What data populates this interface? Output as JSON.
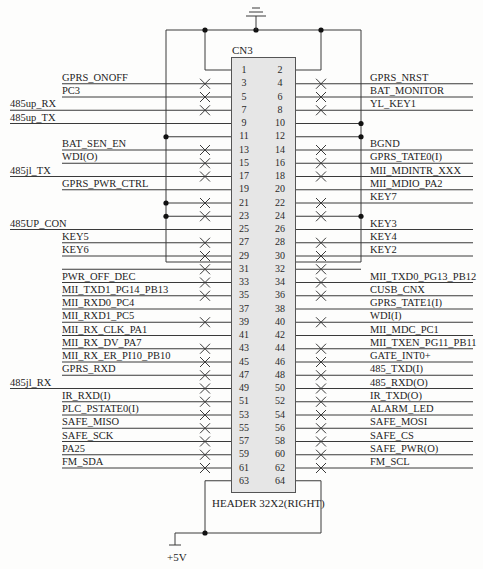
{
  "component": {
    "ref": "CN3",
    "part": "HEADER 32X2(RIGHT)",
    "power_label": "+5V",
    "ground_symbol": "ground-icon"
  },
  "pins": [
    {
      "odd": 1,
      "even": 2,
      "left": "",
      "left_far": false,
      "left_nc": false,
      "right": "",
      "right_nc": false,
      "left_rail": false,
      "right_rail": false
    },
    {
      "odd": 3,
      "even": 4,
      "left": "GPRS_ONOFF",
      "left_far": false,
      "left_nc": true,
      "right": "GPRS_NRST",
      "right_nc": true
    },
    {
      "odd": 5,
      "even": 6,
      "left": "PC3",
      "left_far": false,
      "left_nc": true,
      "right": "BAT_MONITOR",
      "right_nc": true
    },
    {
      "odd": 7,
      "even": 8,
      "left": "485up_RX",
      "left_far": true,
      "left_nc": true,
      "right": "YL_KEY1",
      "right_nc": true
    },
    {
      "odd": 9,
      "even": 10,
      "left": "485up_TX",
      "left_far": true,
      "left_nc": false,
      "right": "",
      "right_nc": false,
      "right_rail": true
    },
    {
      "odd": 11,
      "even": 12,
      "left": "",
      "left_far": false,
      "left_nc": false,
      "left_rail": true,
      "right": "",
      "right_nc": false,
      "right_rail": true
    },
    {
      "odd": 13,
      "even": 14,
      "left": "BAT_SEN_EN",
      "left_far": false,
      "left_nc": true,
      "right": "BGND",
      "right_nc": true
    },
    {
      "odd": 15,
      "even": 16,
      "left": "WDI(O)",
      "left_far": false,
      "left_nc": true,
      "right": "GPRS_TATE0(I)",
      "right_nc": true
    },
    {
      "odd": 17,
      "even": 18,
      "left": "485jl_TX",
      "left_far": true,
      "left_nc": true,
      "right": "MII_MDINTR_XXX",
      "right_nc": true
    },
    {
      "odd": 19,
      "even": 20,
      "left": "GPRS_PWR_CTRL",
      "left_far": false,
      "left_nc": false,
      "right": "MII_MDIO_PA2",
      "right_nc": false
    },
    {
      "odd": 21,
      "even": 22,
      "left": "",
      "left_far": false,
      "left_nc": true,
      "left_rail": true,
      "right": "KEY7",
      "right_nc": true
    },
    {
      "odd": 23,
      "even": 24,
      "left": "",
      "left_far": false,
      "left_nc": true,
      "left_rail": true,
      "right": "",
      "right_nc": true,
      "right_rail": true
    },
    {
      "odd": 25,
      "even": 26,
      "left": "485UP_CON",
      "left_far": true,
      "left_nc": false,
      "right": "KEY3",
      "right_nc": false
    },
    {
      "odd": 27,
      "even": 28,
      "left": "KEY5",
      "left_far": false,
      "left_nc": true,
      "right": "KEY4",
      "right_nc": true
    },
    {
      "odd": 29,
      "even": 30,
      "left": "KEY6",
      "left_far": false,
      "left_nc": true,
      "right": "KEY2",
      "right_nc": true
    },
    {
      "odd": 31,
      "even": 32,
      "left": "",
      "left_far": false,
      "left_nc": true,
      "right": "",
      "right_nc": true
    },
    {
      "odd": 33,
      "even": 34,
      "left": "PWR_OFF_DEC",
      "left_far": false,
      "left_nc": true,
      "right": "MII_TXD0_PG13_PB12",
      "right_nc": true
    },
    {
      "odd": 35,
      "even": 36,
      "left": "MII_TXD1_PG14_PB13",
      "left_far": false,
      "left_nc": true,
      "right": "CUSB_CNX",
      "right_nc": true
    },
    {
      "odd": 37,
      "even": 38,
      "left": "MII_RXD0_PC4",
      "left_far": false,
      "left_nc": false,
      "right": "GPRS_TATE1(I)",
      "right_nc": false
    },
    {
      "odd": 39,
      "even": 40,
      "left": "MII_RXD1_PC5",
      "left_far": false,
      "left_nc": true,
      "right": "WDI(I)",
      "right_nc": true
    },
    {
      "odd": 41,
      "even": 42,
      "left": "MII_RX_CLK_PA1",
      "left_far": false,
      "left_nc": false,
      "right": "MII_MDC_PC1",
      "right_nc": false
    },
    {
      "odd": 43,
      "even": 44,
      "left": "MII_RX_DV_PA7",
      "left_far": false,
      "left_nc": true,
      "right": "MII_TXEN_PG11_PB11",
      "right_nc": true
    },
    {
      "odd": 45,
      "even": 46,
      "left": "MII_RX_ER_PI10_PB10",
      "left_far": false,
      "left_nc": true,
      "right": "GATE_INT0+",
      "right_nc": true
    },
    {
      "odd": 47,
      "even": 48,
      "left": "GPRS_RXD",
      "left_far": false,
      "left_nc": true,
      "right": "485_TXD(I)",
      "right_nc": true
    },
    {
      "odd": 49,
      "even": 50,
      "left": "485jl_RX",
      "left_far": true,
      "left_nc": true,
      "right": "485_RXD(O)",
      "right_nc": true
    },
    {
      "odd": 51,
      "even": 52,
      "left": "IR_RXD(I)",
      "left_far": false,
      "left_nc": true,
      "right": "IR_TXD(O)",
      "right_nc": true
    },
    {
      "odd": 53,
      "even": 54,
      "left": "PLC_PSTATE0(I)",
      "left_far": false,
      "left_nc": true,
      "right": "ALARM_LED",
      "right_nc": true
    },
    {
      "odd": 55,
      "even": 56,
      "left": "SAFE_MISO",
      "left_far": false,
      "left_nc": true,
      "right": "SAFE_MOSI",
      "right_nc": true
    },
    {
      "odd": 57,
      "even": 58,
      "left": "SAFE_SCK",
      "left_far": false,
      "left_nc": true,
      "right": "SAFE_CS",
      "right_nc": true
    },
    {
      "odd": 59,
      "even": 60,
      "left": "PA25",
      "left_far": false,
      "left_nc": true,
      "right": "SAFE_PWR(O)",
      "right_nc": true
    },
    {
      "odd": 61,
      "even": 62,
      "left": "FM_SDA",
      "left_far": false,
      "left_nc": true,
      "right": "FM_SCL",
      "right_nc": true
    },
    {
      "odd": 63,
      "even": 64,
      "left": "",
      "left_far": false,
      "left_nc": false,
      "right": "",
      "right_nc": false
    }
  ],
  "colors": {
    "wire": "#3a3a3a",
    "header_fill": "#e6e6e6",
    "background": "#fdfdfc"
  }
}
